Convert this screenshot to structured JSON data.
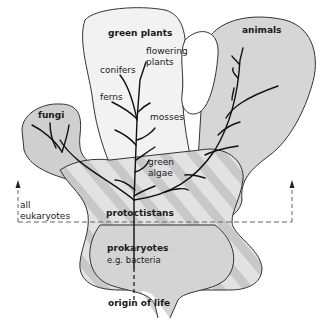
{
  "diagram": {
    "type": "evolutionary-tree",
    "groups": {
      "green_plants": "green plants",
      "animals": "animals",
      "fungi": "fungi",
      "protoctistans": "protoctistans",
      "prokaryotes": "prokaryotes",
      "prokaryotes_example": "e.g. bacteria",
      "origin": "origin of life"
    },
    "plant_branches": {
      "flowering_1": "flowering",
      "flowering_2": "plants",
      "conifers": "conifers",
      "ferns": "ferns",
      "mosses": "mosses",
      "green_algae_1": "green",
      "green_algae_2": "algae"
    },
    "eukaryote_marker": {
      "line1": "all",
      "line2": "eukaryotes"
    },
    "colors": {
      "blob_fill": "#d9d9d9",
      "blob_light": "#ececec",
      "stripe": "#c4c4c4",
      "outline": "#333333",
      "branch": "#111111"
    }
  }
}
